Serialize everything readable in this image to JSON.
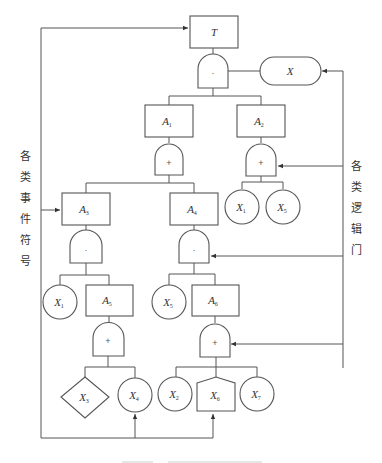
{
  "diagram": {
    "type": "fault-tree",
    "top_event": {
      "id": "T",
      "label": "T",
      "sub": ""
    },
    "condition_event": {
      "id": "X",
      "label": "X",
      "sub": ""
    },
    "intermediate_events": [
      {
        "id": "A1",
        "label": "A",
        "sub": "1"
      },
      {
        "id": "A2",
        "label": "A",
        "sub": "2"
      },
      {
        "id": "A3",
        "label": "A",
        "sub": "3"
      },
      {
        "id": "A4",
        "label": "A",
        "sub": "4"
      },
      {
        "id": "A5",
        "label": "A",
        "sub": "5"
      },
      {
        "id": "A6",
        "label": "A",
        "sub": "6"
      }
    ],
    "basic_events": [
      {
        "id": "X1a",
        "label": "X",
        "sub": "1"
      },
      {
        "id": "X5a",
        "label": "X",
        "sub": "5"
      },
      {
        "id": "X1b",
        "label": "X",
        "sub": "1"
      },
      {
        "id": "X5b",
        "label": "X",
        "sub": "5"
      },
      {
        "id": "X4",
        "label": "X",
        "sub": "4"
      },
      {
        "id": "X2",
        "label": "X",
        "sub": "2"
      },
      {
        "id": "X7",
        "label": "X",
        "sub": "7"
      }
    ],
    "undeveloped_events": [
      {
        "id": "X3",
        "label": "X",
        "sub": "3"
      }
    ],
    "house_events": [
      {
        "id": "X6",
        "label": "X",
        "sub": "6"
      }
    ],
    "gates": {
      "and_symbol": "·",
      "or_symbol": "+"
    },
    "side_labels": {
      "left": [
        "各",
        "类",
        "事",
        "件",
        "符",
        "号"
      ],
      "right": [
        "各",
        "类",
        "逻",
        "辑",
        "门"
      ]
    },
    "edges": [
      [
        "T",
        "G_T_and"
      ],
      [
        "G_T_and",
        "X"
      ],
      [
        "G_T_and",
        "A1"
      ],
      [
        "G_T_and",
        "A2"
      ],
      [
        "A1",
        "G_A1_or"
      ],
      [
        "G_A1_or",
        "A3"
      ],
      [
        "G_A1_or",
        "A4"
      ],
      [
        "A2",
        "G_A2_or"
      ],
      [
        "G_A2_or",
        "X1b"
      ],
      [
        "G_A2_or",
        "X5b"
      ],
      [
        "A3",
        "G_A3_and"
      ],
      [
        "G_A3_and",
        "X1a"
      ],
      [
        "G_A3_and",
        "A5"
      ],
      [
        "A4",
        "G_A4_and"
      ],
      [
        "G_A4_and",
        "X5a"
      ],
      [
        "G_A4_and",
        "A6"
      ],
      [
        "A5",
        "G_A5_or"
      ],
      [
        "G_A5_or",
        "X3"
      ],
      [
        "G_A5_or",
        "X4"
      ],
      [
        "A6",
        "G_A6_or"
      ],
      [
        "G_A6_or",
        "X2"
      ],
      [
        "G_A6_or",
        "X6"
      ],
      [
        "G_A6_or",
        "X7"
      ]
    ]
  }
}
